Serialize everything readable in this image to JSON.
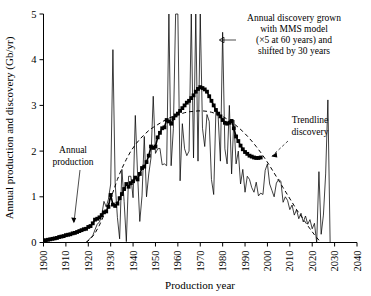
{
  "chart_data": {
    "type": "line",
    "title": "",
    "xlabel": "Production year",
    "ylabel": "Annual production and discovery (Gb/yr)",
    "xlim": [
      1900,
      2040
    ],
    "ylim": [
      0,
      5
    ],
    "xticks": [
      1900,
      1910,
      1920,
      1930,
      1940,
      1950,
      1960,
      1970,
      1980,
      1990,
      2000,
      2010,
      2020,
      2030,
      2040
    ],
    "yticks": [
      0,
      1,
      2,
      3,
      4,
      5
    ],
    "xtick_labels": [
      "1900",
      "1910",
      "1920",
      "1930",
      "1940",
      "1950",
      "1960",
      "1970",
      "1980",
      "1990",
      "2000",
      "2010",
      "2020",
      "2030",
      "2040"
    ],
    "ytick_labels": [
      "0",
      "1",
      "2",
      "3",
      "4",
      "5"
    ],
    "grid": false,
    "legend_position": "none",
    "series": [
      {
        "name": "Annual production",
        "style": "line-with-square-markers",
        "x": [
          1900,
          1901,
          1902,
          1903,
          1904,
          1905,
          1906,
          1907,
          1908,
          1909,
          1910,
          1911,
          1912,
          1913,
          1914,
          1915,
          1916,
          1917,
          1918,
          1919,
          1920,
          1921,
          1922,
          1923,
          1924,
          1925,
          1926,
          1927,
          1928,
          1929,
          1930,
          1931,
          1932,
          1933,
          1934,
          1935,
          1936,
          1937,
          1938,
          1939,
          1940,
          1941,
          1942,
          1943,
          1944,
          1945,
          1946,
          1947,
          1948,
          1949,
          1950,
          1951,
          1952,
          1953,
          1954,
          1955,
          1956,
          1957,
          1958,
          1959,
          1960,
          1961,
          1962,
          1963,
          1964,
          1965,
          1966,
          1967,
          1968,
          1969,
          1970,
          1971,
          1972,
          1973,
          1974,
          1975,
          1976,
          1977,
          1978,
          1979,
          1980,
          1981,
          1982,
          1983,
          1984,
          1985,
          1986,
          1987,
          1988,
          1989,
          1990,
          1991,
          1992,
          1993,
          1994,
          1995,
          1996,
          1997
        ],
        "values": [
          0.04,
          0.05,
          0.06,
          0.07,
          0.08,
          0.09,
          0.1,
          0.12,
          0.13,
          0.14,
          0.16,
          0.17,
          0.18,
          0.2,
          0.21,
          0.23,
          0.25,
          0.27,
          0.29,
          0.3,
          0.34,
          0.36,
          0.42,
          0.5,
          0.52,
          0.55,
          0.6,
          0.66,
          0.68,
          0.78,
          1.04,
          0.83,
          0.8,
          0.85,
          0.97,
          1.06,
          1.17,
          1.28,
          1.22,
          1.3,
          1.34,
          1.42,
          1.38,
          1.5,
          1.63,
          1.66,
          1.76,
          1.9,
          2.1,
          2.07,
          2.1,
          2.3,
          2.4,
          2.5,
          2.52,
          2.68,
          2.65,
          2.6,
          2.72,
          2.78,
          2.82,
          2.88,
          2.94,
          3.0,
          3.06,
          3.1,
          3.16,
          3.22,
          3.3,
          3.36,
          3.4,
          3.38,
          3.35,
          3.3,
          3.2,
          3.1,
          3.0,
          2.9,
          2.82,
          2.76,
          2.68,
          2.62,
          2.6,
          2.62,
          2.66,
          2.5,
          2.32,
          2.22,
          2.12,
          2.04,
          1.98,
          1.94,
          1.9,
          1.88,
          1.86,
          1.85,
          1.85,
          1.86
        ]
      },
      {
        "name": "Annual discovery grown with MMS model",
        "style": "thin-line",
        "x": [
          1919,
          1920,
          1921,
          1922,
          1923,
          1924,
          1925,
          1926,
          1927,
          1928,
          1929,
          1930,
          1931,
          1932,
          1933,
          1934,
          1935,
          1936,
          1937,
          1938,
          1939,
          1940,
          1941,
          1942,
          1943,
          1944,
          1945,
          1946,
          1947,
          1948,
          1949,
          1950,
          1951,
          1952,
          1953,
          1954,
          1955,
          1956,
          1957,
          1958,
          1959,
          1960,
          1961,
          1962,
          1963,
          1964,
          1965,
          1966,
          1967,
          1968,
          1969,
          1970,
          1971,
          1972,
          1973,
          1974,
          1975,
          1976,
          1977,
          1978,
          1979,
          1980,
          1981,
          1982,
          1983,
          1984,
          1985,
          1986,
          1987,
          1988,
          1989,
          1990,
          1991,
          1992,
          1993,
          1994,
          1995,
          1996,
          1997,
          1998,
          1999,
          2000,
          2001,
          2002,
          2003,
          2004,
          2005,
          2006,
          2007,
          2008,
          2009,
          2010,
          2011,
          2012,
          2013,
          2014,
          2015,
          2016,
          2017,
          2018,
          2019,
          2020,
          2021,
          2022,
          2023,
          2024,
          2025,
          2026,
          2027,
          2028
        ],
        "values": [
          0.0,
          0.05,
          0.1,
          0.15,
          0.28,
          0.4,
          0.45,
          0.6,
          0.9,
          0.78,
          0.95,
          1.28,
          4.22,
          1.3,
          0.55,
          0.08,
          1.6,
          0.9,
          0.02,
          1.45,
          1.45,
          0.98,
          2.78,
          1.5,
          0.46,
          1.02,
          2.32,
          1.0,
          1.5,
          1.85,
          3.2,
          1.95,
          2.05,
          2.06,
          1.7,
          1.72,
          1.68,
          5.0,
          1.68,
          2.5,
          5.0,
          5.0,
          1.35,
          2.6,
          2.05,
          1.9,
          2.0,
          5.0,
          1.85,
          5.0,
          1.78,
          5.0,
          2.5,
          2.1,
          2.8,
          2.65,
          1.38,
          1.05,
          2.9,
          2.75,
          1.78,
          4.6,
          2.05,
          1.72,
          3.0,
          1.5,
          2.68,
          1.72,
          2.0,
          1.28,
          1.6,
          1.1,
          1.45,
          1.38,
          1.2,
          1.1,
          1.32,
          1.02,
          1.08,
          1.05,
          1.58,
          1.72,
          1.28,
          1.14,
          1.0,
          1.3,
          1.38,
          1.34,
          0.88,
          1.0,
          0.92,
          0.72,
          0.82,
          0.6,
          0.72,
          0.52,
          0.64,
          0.45,
          0.58,
          0.4,
          0.5,
          0.3,
          0.42,
          0.0,
          1.55,
          0.18,
          0.6,
          1.5,
          3.12,
          0.0
        ]
      },
      {
        "name": "Trendline discovery",
        "style": "dashed",
        "x": [
          1919,
          1921,
          1923,
          1925,
          1927,
          1929,
          1931,
          1933,
          1935,
          1937,
          1939,
          1941,
          1943,
          1945,
          1947,
          1949,
          1951,
          1953,
          1955,
          1957,
          1959,
          1961,
          1963,
          1965,
          1967,
          1969,
          1971,
          1973,
          1975,
          1977,
          1979,
          1981,
          1983,
          1985,
          1987,
          1989,
          1991,
          1993,
          1995,
          1997,
          1999,
          2001,
          2003,
          2005,
          2007,
          2009,
          2011,
          2013,
          2015,
          2017,
          2019,
          2021,
          2023
        ],
        "values": [
          0.0,
          0.08,
          0.2,
          0.38,
          0.6,
          0.85,
          1.1,
          1.38,
          1.62,
          1.82,
          2.0,
          2.14,
          2.26,
          2.36,
          2.45,
          2.52,
          2.58,
          2.64,
          2.7,
          2.74,
          2.78,
          2.81,
          2.84,
          2.86,
          2.87,
          2.88,
          2.88,
          2.87,
          2.85,
          2.82,
          2.78,
          2.73,
          2.67,
          2.6,
          2.52,
          2.43,
          2.33,
          2.22,
          2.1,
          1.97,
          1.83,
          1.68,
          1.52,
          1.36,
          1.2,
          1.04,
          0.88,
          0.72,
          0.58,
          0.44,
          0.3,
          0.17,
          0.05
        ]
      }
    ],
    "annotations": [
      {
        "id": "discovery-annotation",
        "lines": [
          "Annual discovery grown",
          "with MMS model",
          "(×5 at 60 years) and",
          "shifted by 30 years"
        ],
        "has_arrow": true
      },
      {
        "id": "trendline-annotation",
        "lines": [
          "Trendline",
          "discovery"
        ],
        "has_arrow": true
      },
      {
        "id": "production-annotation",
        "lines": [
          "Annual",
          "production"
        ],
        "has_arrow": true
      }
    ]
  },
  "colors": {
    "background": "#ffffff",
    "ink": "#000000"
  }
}
